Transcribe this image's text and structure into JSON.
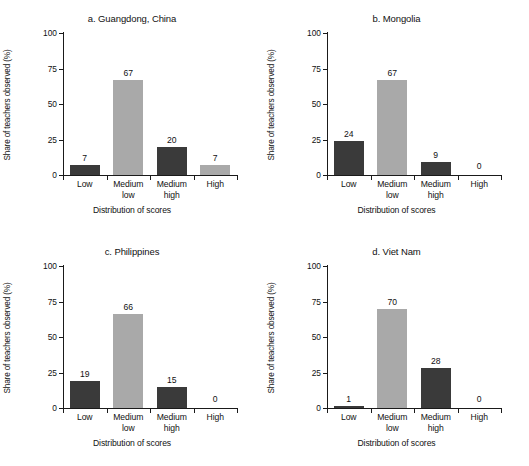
{
  "chart_data": [
    {
      "type": "bar",
      "title": "a. Guangdong, China",
      "categories": [
        "Low",
        "Medium low",
        "Medium high",
        "High"
      ],
      "values": [
        7,
        67,
        20,
        7
      ],
      "bar_colors": [
        "#3a3a3a",
        "#a9a9a9",
        "#3a3a3a",
        "#a9a9a9"
      ],
      "xlabel": "Distribution of scores",
      "ylabel": "Share of teachers observed (%)",
      "ylim": [
        0,
        100
      ],
      "yticks": [
        0,
        25,
        50,
        75,
        100
      ],
      "grid": false,
      "legend": "none"
    },
    {
      "type": "bar",
      "title": "b. Mongolia",
      "categories": [
        "Low",
        "Medium low",
        "Medium high",
        "High"
      ],
      "values": [
        24,
        67,
        9,
        0
      ],
      "bar_colors": [
        "#3a3a3a",
        "#a9a9a9",
        "#3a3a3a",
        "#a9a9a9"
      ],
      "xlabel": "Distribution of scores",
      "ylabel": "Share of teachers observed (%)",
      "ylim": [
        0,
        100
      ],
      "yticks": [
        0,
        25,
        50,
        75,
        100
      ],
      "grid": false,
      "legend": "none"
    },
    {
      "type": "bar",
      "title": "c. Philippines",
      "categories": [
        "Low",
        "Medium low",
        "Medium high",
        "High"
      ],
      "values": [
        19,
        66,
        15,
        0
      ],
      "bar_colors": [
        "#3a3a3a",
        "#a9a9a9",
        "#3a3a3a",
        "#a9a9a9"
      ],
      "xlabel": "Distribution of scores",
      "ylabel": "Share of teachers observed (%)",
      "ylim": [
        0,
        100
      ],
      "yticks": [
        0,
        25,
        50,
        75,
        100
      ],
      "grid": false,
      "legend": "none"
    },
    {
      "type": "bar",
      "title": "d. Viet Nam",
      "categories": [
        "Low",
        "Medium low",
        "Medium high",
        "High"
      ],
      "values": [
        1,
        70,
        28,
        0
      ],
      "bar_colors": [
        "#3a3a3a",
        "#a9a9a9",
        "#3a3a3a",
        "#a9a9a9"
      ],
      "xlabel": "Distribution of scores",
      "ylabel": "Share of teachers observed (%)",
      "ylim": [
        0,
        100
      ],
      "yticks": [
        0,
        25,
        50,
        75,
        100
      ],
      "grid": false,
      "legend": "none"
    }
  ],
  "panels": [
    {
      "title": "a. Guangdong, China",
      "ylabel": "Share of teachers observed (%)",
      "xlabel": "Distribution of scores",
      "yticklabels": [
        "100",
        "75",
        "50",
        "25",
        "0"
      ],
      "cat_lines": [
        [
          "Low",
          ""
        ],
        [
          "Medium",
          "low"
        ],
        [
          "Medium",
          "high"
        ],
        [
          "High",
          ""
        ]
      ],
      "value_labels": [
        "7",
        "67",
        "20",
        "7"
      ]
    },
    {
      "title": "b. Mongolia",
      "ylabel": "Share of teachers observed (%)",
      "xlabel": "Distribution of scores",
      "yticklabels": [
        "100",
        "75",
        "50",
        "25",
        "0"
      ],
      "cat_lines": [
        [
          "Low",
          ""
        ],
        [
          "Medium",
          "low"
        ],
        [
          "Medium",
          "high"
        ],
        [
          "High",
          ""
        ]
      ],
      "value_labels": [
        "24",
        "67",
        "9",
        "0"
      ]
    },
    {
      "title": "c. Philippines",
      "ylabel": "Share of teachers observed (%)",
      "xlabel": "Distribution of scores",
      "yticklabels": [
        "100",
        "75",
        "50",
        "25",
        "0"
      ],
      "cat_lines": [
        [
          "Low",
          ""
        ],
        [
          "Medium",
          "low"
        ],
        [
          "Medium",
          "high"
        ],
        [
          "High",
          ""
        ]
      ],
      "value_labels": [
        "19",
        "66",
        "15",
        "0"
      ]
    },
    {
      "title": "d. Viet Nam",
      "ylabel": "Share of teachers observed (%)",
      "xlabel": "Distribution of scores",
      "yticklabels": [
        "100",
        "75",
        "50",
        "25",
        "0"
      ],
      "cat_lines": [
        [
          "Low",
          ""
        ],
        [
          "Medium",
          "low"
        ],
        [
          "Medium",
          "high"
        ],
        [
          "High",
          ""
        ]
      ],
      "value_labels": [
        "1",
        "70",
        "28",
        "0"
      ]
    }
  ]
}
